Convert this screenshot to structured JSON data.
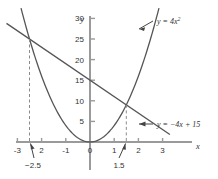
{
  "chart_data": {
    "type": "line",
    "title": "",
    "xlabel": "x",
    "ylabel": "y",
    "xlim": [
      -3.6,
      3.9
    ],
    "ylim": [
      -2,
      33
    ],
    "grid": false,
    "legend_position": "inline-callout",
    "x_ticks": [
      -3,
      -2,
      -1,
      0,
      1,
      2,
      3
    ],
    "x_tick_labels": [
      "-3",
      "2",
      "-1",
      "0",
      "1",
      "2",
      "3"
    ],
    "y_ticks": [
      5,
      10,
      15,
      20,
      25,
      30
    ],
    "y_tick_labels": [
      "5",
      "10",
      "15",
      "20",
      "25",
      "30"
    ],
    "series": [
      {
        "name": "parabola",
        "equation": "y = 4x²",
        "label": "y = 4x",
        "label_exponent": "2",
        "type": "quadratic",
        "coefficients": {
          "a": 4,
          "b": 0,
          "c": 0
        },
        "x_range": [
          -2.85,
          2.85
        ],
        "color": "#555555"
      },
      {
        "name": "line",
        "equation": "y = -4x + 15",
        "label": "y = −4x + 15",
        "type": "linear",
        "slope": -4,
        "intercept": 15,
        "x_range": [
          -3.45,
          3.3
        ],
        "color": "#555555"
      }
    ],
    "intersections": [
      {
        "x": -2.5,
        "y": 25,
        "annotation": "−2.5"
      },
      {
        "x": 1.5,
        "y": 9,
        "annotation": "1.5"
      }
    ],
    "annotations": [
      {
        "text": "−2.5",
        "points_to_x": -2.5
      },
      {
        "text": "1.5",
        "points_to_x": 1.5
      }
    ],
    "colors": {
      "axis": "#9a9a9a",
      "curve": "#555555",
      "dashed": "#8a8a8a",
      "text": "#333333",
      "background": "#ffffff"
    }
  }
}
